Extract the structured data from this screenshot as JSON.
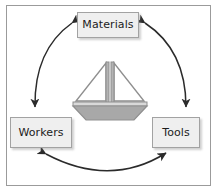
{
  "diagram": {
    "frame": {
      "border_color": "#9b9b9b",
      "background_color": "#ffffff"
    },
    "nodes": [
      {
        "id": "materials",
        "label": "Materials",
        "position": "top-center",
        "fill_color": "#efefef",
        "border_color": "#a2a2a2",
        "text_color": "#1c1c1c"
      },
      {
        "id": "workers",
        "label": "Workers",
        "position": "bottom-left",
        "fill_color": "#efefef",
        "border_color": "#a2a2a2",
        "text_color": "#1c1c1c"
      },
      {
        "id": "tools",
        "label": "Tools",
        "position": "bottom-right",
        "fill_color": "#efefef",
        "border_color": "#a2a2a2",
        "text_color": "#1c1c1c"
      }
    ],
    "connectors": [
      {
        "id": "materials-workers",
        "from": "materials",
        "to": "workers",
        "style": "curved-arc",
        "arrowheads": "both",
        "color": "#2b2b2b"
      },
      {
        "id": "materials-tools",
        "from": "materials",
        "to": "tools",
        "style": "curved-arc",
        "arrowheads": "both",
        "color": "#2b2b2b"
      },
      {
        "id": "workers-tools",
        "from": "workers",
        "to": "tools",
        "style": "curved-arc",
        "arrowheads": "both",
        "color": "#2b2b2b"
      }
    ],
    "center_icon": {
      "name": "sailboat-icon",
      "sail_outline_color": "#8f8f8f",
      "sail_fill_color": "#ffffff",
      "mast_color": "#8f8f8f",
      "hull_fill_color": "#a8a8a8",
      "deck_fill_color": "#d9d9d9"
    }
  }
}
